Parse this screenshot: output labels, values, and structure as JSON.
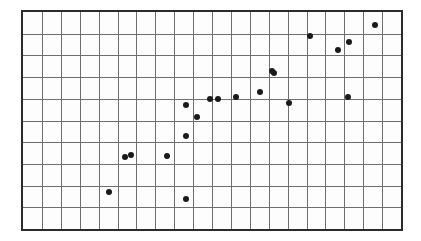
{
  "chart_data": {
    "type": "scatter",
    "title": "",
    "subtitle": "",
    "xlabel": "",
    "ylabel": "",
    "xlim": [
      0,
      20
    ],
    "ylim": [
      0,
      10
    ],
    "grid": true,
    "grid_columns": 20,
    "grid_rows": 10,
    "legend": null,
    "legend_position": "none",
    "tick_labels_x": [],
    "tick_labels_y": [],
    "annotations": [],
    "marker": {
      "shape": "circle",
      "color": "#1a1a1a",
      "size_px": 6
    },
    "style": {
      "frame_color": "#2b2b2b",
      "grid_color": "#6e6e6e",
      "plot_background": "#fdfdfd",
      "page_background": "#ffffff"
    },
    "points": [
      {
        "x": 4.55,
        "y": 1.72
      },
      {
        "x": 5.4,
        "y": 3.32
      },
      {
        "x": 5.7,
        "y": 3.41
      },
      {
        "x": 7.6,
        "y": 3.36
      },
      {
        "x": 8.65,
        "y": 1.36
      },
      {
        "x": 8.65,
        "y": 4.27
      },
      {
        "x": 8.65,
        "y": 5.72
      },
      {
        "x": 9.2,
        "y": 5.18
      },
      {
        "x": 9.9,
        "y": 6.0
      },
      {
        "x": 10.32,
        "y": 6.0
      },
      {
        "x": 11.25,
        "y": 6.09
      },
      {
        "x": 12.55,
        "y": 6.32
      },
      {
        "x": 13.15,
        "y": 7.27
      },
      {
        "x": 13.3,
        "y": 7.18
      },
      {
        "x": 14.1,
        "y": 5.82
      },
      {
        "x": 15.2,
        "y": 8.91
      },
      {
        "x": 16.65,
        "y": 8.27
      },
      {
        "x": 17.2,
        "y": 6.09
      },
      {
        "x": 17.25,
        "y": 8.64
      },
      {
        "x": 18.6,
        "y": 9.41
      }
    ]
  }
}
